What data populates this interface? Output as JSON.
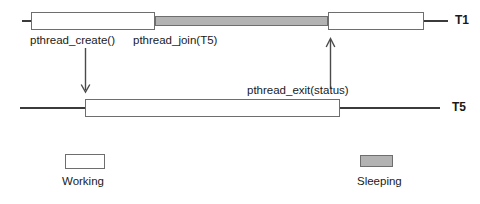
{
  "diagram": {
    "colors": {
      "working_fill": "#ffffff",
      "sleeping_fill": "#b3b3b3",
      "stroke": "#6e6e6e",
      "axis": "#3b3b3b",
      "text": "#1a1a1a"
    }
  },
  "threads": [
    {
      "id": "T1",
      "label": "T1",
      "segments": [
        {
          "state": "Working",
          "start": 31,
          "end": 155
        },
        {
          "state": "Sleeping",
          "start": 155,
          "end": 328
        },
        {
          "state": "Working",
          "start": 328,
          "end": 424
        }
      ]
    },
    {
      "id": "T5",
      "label": "T5",
      "segments": [
        {
          "state": "Working",
          "start": 85,
          "end": 340
        }
      ]
    }
  ],
  "annotations": [
    {
      "name": "pthread-create-label",
      "text": "pthread_create()"
    },
    {
      "name": "pthread-join-label",
      "text": "pthread_join(T5)"
    },
    {
      "name": "pthread-exit-label",
      "text": "pthread_exit(status)"
    }
  ],
  "arrows": [
    {
      "name": "create-arrow",
      "direction": "down",
      "from_thread": "T1",
      "to_thread": "T5"
    },
    {
      "name": "exit-arrow",
      "direction": "up",
      "from_thread": "T5",
      "to_thread": "T1"
    }
  ],
  "legend": [
    {
      "key": "working",
      "label": "Working",
      "swatch": "white"
    },
    {
      "key": "sleeping",
      "label": "Sleeping",
      "swatch": "gray"
    }
  ]
}
